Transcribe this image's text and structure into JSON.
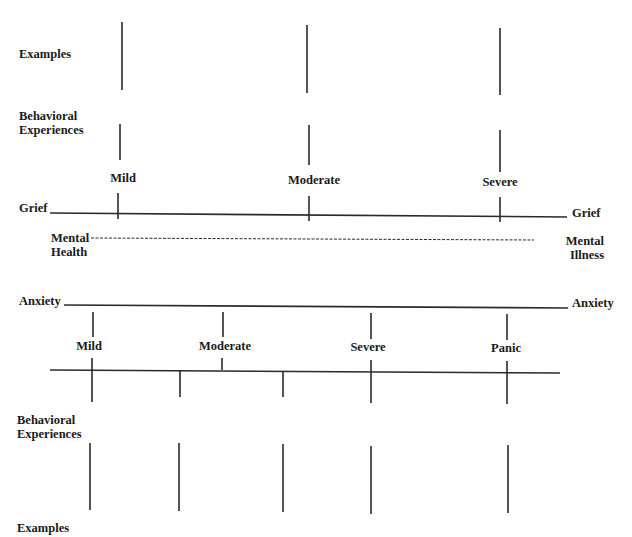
{
  "grief_diagram": {
    "examples_label": "Examples",
    "behavioral_label_line1": "Behavioral",
    "behavioral_label_line2": "Experiences",
    "levels": [
      "Mild",
      "Moderate",
      "Severe"
    ],
    "axis_label_left": "Grief",
    "axis_label_right": "Grief"
  },
  "continuum": {
    "left_line1": "Mental",
    "left_line2": "Health",
    "right_line1": "Mental",
    "right_line2": "Illness"
  },
  "anxiety_diagram": {
    "axis_label_left": "Anxiety",
    "axis_label_right": "Anxiety",
    "levels": [
      "Mild",
      "Moderate",
      "Severe",
      "Panic"
    ],
    "behavioral_label_line1": "Behavioral",
    "behavioral_label_line2": "Experiences",
    "examples_label": "Examples"
  },
  "colors": {
    "line": "#2a2a2a",
    "text": "#1a1a1a",
    "background": "#ffffff"
  }
}
